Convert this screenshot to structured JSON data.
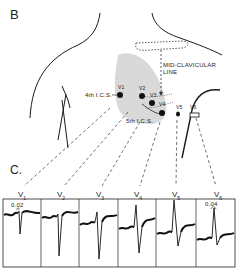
{
  "figure": {
    "panel_b_label": "B",
    "panel_c_label": "C.",
    "annotations": {
      "mid_clavicular_line_1": "MID-CLAVICULAR",
      "mid_clavicular_line_2": "LINE",
      "fourth_ics": "4th  I.C.S.",
      "fifth_ics": "5th I.C.S."
    },
    "electrodes": [
      {
        "id": "V1",
        "label": "V1"
      },
      {
        "id": "V2",
        "label": "V2"
      },
      {
        "id": "V3",
        "label": "V3"
      },
      {
        "id": "V4",
        "label": "V4"
      },
      {
        "id": "V5",
        "label": "V5"
      },
      {
        "id": "V6",
        "label": "V6"
      }
    ],
    "ecg_leads": [
      {
        "label": "V",
        "sub": "1",
        "annotation": "0.02"
      },
      {
        "label": "V",
        "sub": "2",
        "annotation": ""
      },
      {
        "label": "V",
        "sub": "3",
        "annotation": ""
      },
      {
        "label": "V",
        "sub": "4",
        "annotation": ""
      },
      {
        "label": "V",
        "sub": "5",
        "annotation": ""
      },
      {
        "label": "V",
        "sub": "6",
        "annotation": "0.04"
      }
    ],
    "colors": {
      "line": "#1a1a1a",
      "heart_shading": "#d9d9d9",
      "background": "#ffffff"
    }
  }
}
